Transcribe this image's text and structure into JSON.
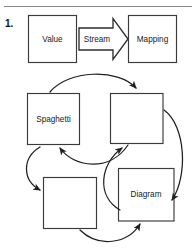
{
  "figure": {
    "item_number": "1.",
    "top_rule": true,
    "top_row": {
      "source_box_label": "Value",
      "arrow_label": "Stream",
      "target_box_label": "Mapping"
    },
    "cycle": {
      "nodes": [
        {
          "id": "node-spaghetti",
          "label": "Spaghetti"
        },
        {
          "id": "node-top-right",
          "label": ""
        },
        {
          "id": "node-bottom-left",
          "label": ""
        },
        {
          "id": "node-diagram",
          "label": "Diagram"
        }
      ],
      "edge_count": 6
    }
  },
  "colors": {
    "background": "#ffffff",
    "box_stroke": "#3a3a3a",
    "arrow_stroke": "#2e2e2e",
    "curve_stroke": "#1f1f1f",
    "text": "#1a1a1a",
    "rule": "#8a8a8a"
  }
}
